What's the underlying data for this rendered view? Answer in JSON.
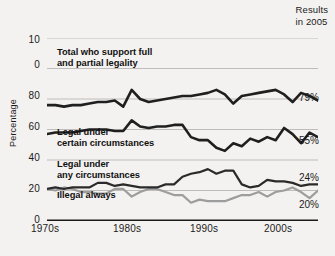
{
  "header": {
    "results_line1": "Results",
    "results_line2": "in 2005"
  },
  "axes": {
    "y_title": "Percentage",
    "y_ticks": [
      "10",
      "0",
      "80",
      "60",
      "40",
      "20",
      "0"
    ],
    "x_ticks": [
      "1970s",
      "1980s",
      "1990s",
      "2000s"
    ]
  },
  "chart_data": {
    "type": "line",
    "title": "",
    "subtitle": "",
    "xlabel": "",
    "ylabel": "Percentage",
    "ylim": [
      0,
      120
    ],
    "y_ticks": [
      0,
      20,
      40,
      60,
      80,
      100,
      120
    ],
    "y_tick_labels": [
      "0",
      "20",
      "40",
      "60",
      "80",
      "0",
      "10"
    ],
    "grid": true,
    "legend": "inline-annotations",
    "x_tick_labels": [
      "1970s",
      "1980s",
      "1990s",
      "2000s"
    ],
    "x_tick_years": [
      1970,
      1980,
      1990,
      2000
    ],
    "xlim": [
      1973,
      2005
    ],
    "annotations": [
      {
        "text": "Results in 2005",
        "position": "top-right"
      }
    ],
    "series": [
      {
        "name": "Total who support full and partial legality",
        "color": "#1f1f1f",
        "width": 2.6,
        "end_label": "79%",
        "end_value": 79,
        "x": [
          1973,
          1974,
          1975,
          1976,
          1977,
          1978,
          1979,
          1980,
          1981,
          1982,
          1983,
          1984,
          1985,
          1986,
          1987,
          1988,
          1989,
          1990,
          1991,
          1992,
          1993,
          1994,
          1995,
          1996,
          1997,
          1998,
          1999,
          2000,
          2001,
          2002,
          2003,
          2004,
          2005
        ],
        "values": [
          76,
          76,
          75,
          76,
          76,
          77,
          78,
          78,
          79,
          75,
          86,
          80,
          78,
          79,
          80,
          81,
          82,
          82,
          83,
          84,
          86,
          83,
          77,
          82,
          83,
          84,
          85,
          86,
          83,
          78,
          84,
          82,
          79
        ]
      },
      {
        "name": "Legal under certain circumstances",
        "color": "#1f1f1f",
        "width": 2.6,
        "end_label": "55%",
        "end_value": 55,
        "x": [
          1973,
          1974,
          1975,
          1976,
          1977,
          1978,
          1979,
          1980,
          1981,
          1982,
          1983,
          1984,
          1985,
          1986,
          1987,
          1988,
          1989,
          1990,
          1991,
          1992,
          1993,
          1994,
          1995,
          1996,
          1997,
          1998,
          1999,
          2000,
          2001,
          2002,
          2003,
          2004,
          2005
        ],
        "values": [
          57,
          58,
          58,
          58,
          59,
          60,
          60,
          60,
          59,
          59,
          66,
          62,
          61,
          62,
          62,
          63,
          63,
          55,
          53,
          53,
          48,
          46,
          51,
          49,
          54,
          52,
          55,
          53,
          61,
          57,
          51,
          58,
          55
        ]
      },
      {
        "name": "Legal under any circumstances",
        "color": "#2a2a2a",
        "width": 2.2,
        "end_label": "24%",
        "end_value": 24,
        "x": [
          1973,
          1974,
          1975,
          1976,
          1977,
          1978,
          1979,
          1980,
          1981,
          1982,
          1983,
          1984,
          1985,
          1986,
          1987,
          1988,
          1989,
          1990,
          1991,
          1992,
          1993,
          1994,
          1995,
          1996,
          1997,
          1998,
          1999,
          2000,
          2001,
          2002,
          2003,
          2004,
          2005
        ],
        "values": [
          21,
          22,
          21,
          22,
          22,
          22,
          25,
          25,
          23,
          24,
          23,
          22,
          22,
          22,
          24,
          24,
          29,
          31,
          32,
          34,
          31,
          33,
          33,
          24,
          22,
          23,
          27,
          26,
          26,
          25,
          23,
          24,
          24
        ]
      },
      {
        "name": "Illegal always",
        "color": "#9d9d9d",
        "width": 2.2,
        "end_label": "20%",
        "end_value": 20,
        "x": [
          1973,
          1974,
          1975,
          1976,
          1977,
          1978,
          1979,
          1980,
          1981,
          1982,
          1983,
          1984,
          1985,
          1986,
          1987,
          1988,
          1989,
          1990,
          1991,
          1992,
          1993,
          1994,
          1995,
          1996,
          1997,
          1998,
          1999,
          2000,
          2001,
          2002,
          2003,
          2004,
          2005
        ],
        "values": [
          21,
          20,
          22,
          21,
          19,
          19,
          18,
          18,
          21,
          21,
          16,
          19,
          21,
          21,
          19,
          17,
          17,
          12,
          14,
          13,
          13,
          13,
          15,
          17,
          17,
          19,
          16,
          19,
          20,
          22,
          19,
          15,
          20
        ]
      }
    ]
  },
  "series_labels": [
    {
      "line1": "Total who support full",
      "line2": "and partial legality"
    },
    {
      "line1": "Legal under",
      "line2": "certain circumstances"
    },
    {
      "line1": "Legal under",
      "line2": "any circumstances"
    },
    {
      "line1": "Illegal always",
      "line2": ""
    }
  ],
  "end_values": [
    "79%",
    "55%",
    "24%",
    "20%"
  ],
  "colors": {
    "background": "#f4f2f0",
    "dark_line": "#1f1f1f",
    "gray_line": "#9d9d9d",
    "gridline": "#b9b6b3",
    "axis": "#1b1b1b",
    "text": "#1b1b1b"
  }
}
